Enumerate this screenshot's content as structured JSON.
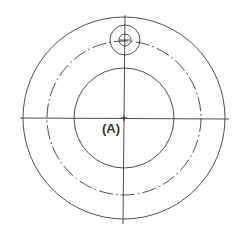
{
  "diagram": {
    "type": "technical drawing - circular flange with offset hole",
    "center_label": "(A)",
    "stroke_color": "#3a3a3a",
    "center": {
      "x": 124,
      "y": 118
    },
    "circles": [
      {
        "name": "outer-circle",
        "r": 101,
        "style": "solid"
      },
      {
        "name": "bolt-circle",
        "r": 77,
        "style": "dash-dot"
      },
      {
        "name": "inner-circle",
        "r": 50,
        "style": "solid"
      }
    ],
    "hole": {
      "cx": 125,
      "cy": 40,
      "outer_r": 15,
      "inner_r": 6
    }
  }
}
